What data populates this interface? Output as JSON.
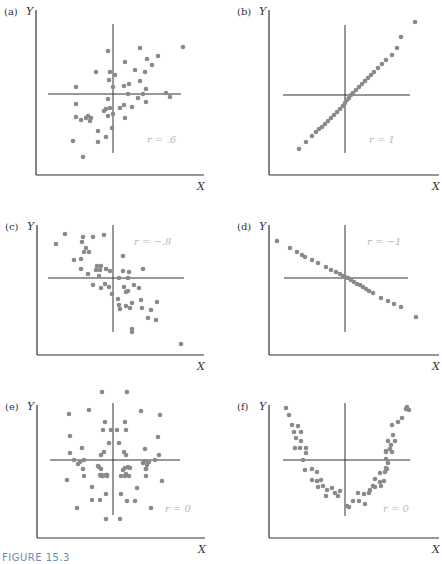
{
  "figure": {
    "caption": "FIGURE 15.3",
    "point_color": "#8a8a8a",
    "axis_color": "#333333",
    "label_color": "#b8b8b8"
  },
  "chart_data": [
    {
      "type": "scatter",
      "panel": "(a)",
      "xlabel": "X",
      "ylabel": "Y",
      "annotation": "r = .6",
      "box": {
        "x": 36,
        "y": 10,
        "w": 168,
        "h": 165
      },
      "cross": {
        "cx": 113,
        "cy": 94,
        "hx1": 48,
        "hx2": 181,
        "vy1": 24,
        "vy2": 153
      },
      "points": [
        [
          108,
          51
        ],
        [
          140,
          48
        ],
        [
          183,
          47
        ],
        [
          147,
          59
        ],
        [
          158,
          56
        ],
        [
          152,
          65
        ],
        [
          125,
          62
        ],
        [
          96,
          72
        ],
        [
          110,
          72
        ],
        [
          115,
          75
        ],
        [
          135,
          70
        ],
        [
          145,
          72
        ],
        [
          109,
          80
        ],
        [
          113,
          87
        ],
        [
          124,
          86
        ],
        [
          129,
          84
        ],
        [
          140,
          81
        ],
        [
          146,
          89
        ],
        [
          76,
          87
        ],
        [
          128,
          94
        ],
        [
          143,
          94
        ],
        [
          166,
          93
        ],
        [
          170,
          97
        ],
        [
          146,
          102
        ],
        [
          138,
          98
        ],
        [
          76,
          104
        ],
        [
          108,
          99
        ],
        [
          106,
          109
        ],
        [
          104,
          111
        ],
        [
          110,
          108
        ],
        [
          108,
          116
        ],
        [
          113,
          114
        ],
        [
          120,
          108
        ],
        [
          124,
          105
        ],
        [
          132,
          107
        ],
        [
          125,
          118
        ],
        [
          76,
          117
        ],
        [
          81,
          120
        ],
        [
          86,
          118
        ],
        [
          88,
          116
        ],
        [
          91,
          118
        ],
        [
          90,
          121
        ],
        [
          98,
          131
        ],
        [
          106,
          137
        ],
        [
          112,
          128
        ],
        [
          73,
          141
        ],
        [
          98,
          142
        ],
        [
          83,
          157
        ]
      ]
    },
    {
      "type": "scatter",
      "panel": "(b)",
      "xlabel": "X",
      "ylabel": "Y",
      "annotation": "r = 1",
      "box": {
        "x": 269,
        "y": 10,
        "w": 170,
        "h": 165
      },
      "cross": {
        "cx": 345,
        "cy": 95,
        "hx1": 283,
        "hx2": 410,
        "vy1": 25,
        "vy2": 153
      },
      "points": [
        [
          299,
          149
        ],
        [
          306,
          142
        ],
        [
          312,
          136
        ],
        [
          316,
          132
        ],
        [
          319,
          129
        ],
        [
          322,
          127
        ],
        [
          325,
          124
        ],
        [
          328,
          121
        ],
        [
          331,
          118
        ],
        [
          334,
          115
        ],
        [
          337,
          112
        ],
        [
          340,
          109
        ],
        [
          343,
          106
        ],
        [
          345,
          103
        ],
        [
          347,
          100
        ],
        [
          349,
          98
        ],
        [
          351,
          95
        ],
        [
          353,
          93
        ],
        [
          356,
          90
        ],
        [
          359,
          87
        ],
        [
          362,
          84
        ],
        [
          365,
          81
        ],
        [
          368,
          78
        ],
        [
          371,
          75
        ],
        [
          374,
          72
        ],
        [
          378,
          68
        ],
        [
          382,
          64
        ],
        [
          386,
          60
        ],
        [
          392,
          55
        ],
        [
          397,
          48
        ],
        [
          401,
          37
        ],
        [
          415,
          22
        ]
      ]
    },
    {
      "type": "scatter",
      "panel": "(c)",
      "xlabel": "X",
      "ylabel": "Y",
      "annotation": "r = −.8",
      "box": {
        "x": 37,
        "y": 225,
        "w": 167,
        "h": 130
      },
      "cross": {
        "cx": 113,
        "cy": 278,
        "hx1": 48,
        "hx2": 184,
        "vy1": 225,
        "vy2": 332
      },
      "points": [
        [
          65,
          234
        ],
        [
          56,
          244
        ],
        [
          83,
          237
        ],
        [
          93,
          237
        ],
        [
          104,
          235
        ],
        [
          82,
          242
        ],
        [
          86,
          248
        ],
        [
          84,
          252
        ],
        [
          89,
          252
        ],
        [
          74,
          260
        ],
        [
          81,
          259
        ],
        [
          123,
          256
        ],
        [
          81,
          269
        ],
        [
          97,
          266
        ],
        [
          101,
          266
        ],
        [
          96,
          270
        ],
        [
          100,
          270
        ],
        [
          106,
          269
        ],
        [
          110,
          271
        ],
        [
          123,
          271
        ],
        [
          129,
          272
        ],
        [
          143,
          269
        ],
        [
          88,
          274
        ],
        [
          99,
          276
        ],
        [
          128,
          278
        ],
        [
          119,
          278
        ],
        [
          93,
          285
        ],
        [
          101,
          288
        ],
        [
          105,
          284
        ],
        [
          109,
          287
        ],
        [
          124,
          287
        ],
        [
          128,
          291
        ],
        [
          134,
          285
        ],
        [
          139,
          288
        ],
        [
          112,
          294
        ],
        [
          118,
          299
        ],
        [
          126,
          292
        ],
        [
          119,
          305
        ],
        [
          141,
          300
        ],
        [
          157,
          302
        ],
        [
          120,
          309
        ],
        [
          126,
          306
        ],
        [
          130,
          308
        ],
        [
          132,
          303
        ],
        [
          142,
          308
        ],
        [
          151,
          310
        ],
        [
          148,
          318
        ],
        [
          156,
          320
        ],
        [
          132,
          329
        ],
        [
          132,
          332
        ],
        [
          181,
          344
        ]
      ]
    },
    {
      "type": "scatter",
      "panel": "(d)",
      "xlabel": "X",
      "ylabel": "Y",
      "annotation": "r = −1",
      "box": {
        "x": 269,
        "y": 225,
        "w": 170,
        "h": 130
      },
      "cross": {
        "cx": 345,
        "cy": 278,
        "hx1": 284,
        "hx2": 408,
        "vy1": 225,
        "vy2": 332
      },
      "points": [
        [
          277,
          241
        ],
        [
          290,
          248
        ],
        [
          297,
          252
        ],
        [
          302,
          255
        ],
        [
          305,
          257
        ],
        [
          312,
          260
        ],
        [
          318,
          263
        ],
        [
          326,
          267
        ],
        [
          331,
          270
        ],
        [
          336,
          272
        ],
        [
          340,
          274
        ],
        [
          343,
          276
        ],
        [
          345,
          277
        ],
        [
          348,
          278
        ],
        [
          351,
          280
        ],
        [
          354,
          282
        ],
        [
          357,
          284
        ],
        [
          360,
          285
        ],
        [
          363,
          287
        ],
        [
          366,
          289
        ],
        [
          369,
          291
        ],
        [
          373,
          293
        ],
        [
          381,
          298
        ],
        [
          388,
          301
        ],
        [
          394,
          304
        ],
        [
          401,
          307
        ],
        [
          416,
          317
        ]
      ]
    },
    {
      "type": "scatter",
      "panel": "(e)",
      "xlabel": "X",
      "ylabel": "Y",
      "annotation": "r = 0",
      "box": {
        "x": 37,
        "y": 405,
        "w": 168,
        "h": 133
      },
      "cross": {
        "cx": 113,
        "cy": 460,
        "hx1": 50,
        "hx2": 180,
        "vy1": 403,
        "vy2": 515
      },
      "points": [
        [
          102,
          392
        ],
        [
          127,
          392
        ],
        [
          69,
          414
        ],
        [
          89,
          410
        ],
        [
          141,
          411
        ],
        [
          160,
          415
        ],
        [
          105,
          422
        ],
        [
          125,
          422
        ],
        [
          103,
          430
        ],
        [
          111,
          430
        ],
        [
          117,
          430
        ],
        [
          126,
          430
        ],
        [
          70,
          436
        ],
        [
          158,
          437
        ],
        [
          109,
          443
        ],
        [
          119,
          443
        ],
        [
          82,
          448
        ],
        [
          145,
          449
        ],
        [
          70,
          453
        ],
        [
          104,
          452
        ],
        [
          101,
          455
        ],
        [
          124,
          452
        ],
        [
          126,
          455
        ],
        [
          159,
          455
        ],
        [
          74,
          460
        ],
        [
          84,
          460
        ],
        [
          145,
          461
        ],
        [
          155,
          460
        ],
        [
          80,
          462
        ],
        [
          78,
          464
        ],
        [
          98,
          466
        ],
        [
          99,
          467
        ],
        [
          125,
          468
        ],
        [
          130,
          468
        ],
        [
          143,
          463
        ],
        [
          147,
          465
        ],
        [
          149,
          462
        ],
        [
          101,
          469
        ],
        [
          123,
          470
        ],
        [
          128,
          467
        ],
        [
          146,
          469
        ],
        [
          83,
          469
        ],
        [
          146,
          469
        ],
        [
          100,
          475
        ],
        [
          101,
          476
        ],
        [
          102,
          475
        ],
        [
          106,
          475
        ],
        [
          126,
          474
        ],
        [
          129,
          476
        ],
        [
          84,
          476
        ],
        [
          146,
          476
        ],
        [
          102,
          476
        ],
        [
          107,
          475
        ],
        [
          107,
          475
        ],
        [
          67,
          480
        ],
        [
          162,
          481
        ],
        [
          103,
          476
        ],
        [
          107,
          476
        ],
        [
          121,
          476
        ],
        [
          125,
          476
        ],
        [
          92,
          487
        ],
        [
          137,
          488
        ],
        [
          106,
          494
        ],
        [
          121,
          494
        ],
        [
          92,
          500
        ],
        [
          100,
          500
        ],
        [
          127,
          501
        ],
        [
          135,
          501
        ],
        [
          77,
          508
        ],
        [
          151,
          508
        ],
        [
          106,
          519
        ],
        [
          120,
          519
        ]
      ]
    },
    {
      "type": "scatter",
      "panel": "(f)",
      "xlabel": "X",
      "ylabel": "Y",
      "annotation": "r = 0",
      "box": {
        "x": 269,
        "y": 405,
        "w": 170,
        "h": 133
      },
      "cross": {
        "cx": 345,
        "cy": 460,
        "hx1": 283,
        "hx2": 410,
        "vy1": 403,
        "vy2": 516
      },
      "points": [
        [
          286,
          408
        ],
        [
          289,
          415
        ],
        [
          292,
          425
        ],
        [
          298,
          426
        ],
        [
          294,
          432
        ],
        [
          301,
          432
        ],
        [
          296,
          438
        ],
        [
          301,
          441
        ],
        [
          295,
          448
        ],
        [
          300,
          448
        ],
        [
          306,
          448
        ],
        [
          306,
          453
        ],
        [
          303,
          460
        ],
        [
          305,
          470
        ],
        [
          312,
          469
        ],
        [
          317,
          472
        ],
        [
          312,
          480
        ],
        [
          317,
          481
        ],
        [
          321,
          480
        ],
        [
          318,
          487
        ],
        [
          323,
          486
        ],
        [
          327,
          490
        ],
        [
          332,
          488
        ],
        [
          326,
          496
        ],
        [
          338,
          496
        ],
        [
          335,
          493
        ],
        [
          340,
          491
        ],
        [
          347,
          506
        ],
        [
          349,
          507
        ],
        [
          353,
          501
        ],
        [
          359,
          501
        ],
        [
          365,
          504
        ],
        [
          358,
          493
        ],
        [
          364,
          494
        ],
        [
          369,
          493
        ],
        [
          370,
          490
        ],
        [
          373,
          486
        ],
        [
          375,
          487
        ],
        [
          380,
          482
        ],
        [
          381,
          486
        ],
        [
          375,
          479
        ],
        [
          384,
          481
        ],
        [
          385,
          472
        ],
        [
          380,
          473
        ],
        [
          387,
          469
        ],
        [
          386,
          468
        ],
        [
          388,
          463
        ],
        [
          386,
          459
        ],
        [
          386,
          452
        ],
        [
          386,
          451
        ],
        [
          390,
          449
        ],
        [
          392,
          452
        ],
        [
          391,
          445
        ],
        [
          388,
          441
        ],
        [
          395,
          441
        ],
        [
          393,
          435
        ],
        [
          392,
          425
        ],
        [
          398,
          422
        ],
        [
          402,
          418
        ],
        [
          406,
          409
        ],
        [
          407,
          407
        ],
        [
          409,
          410
        ]
      ]
    }
  ]
}
